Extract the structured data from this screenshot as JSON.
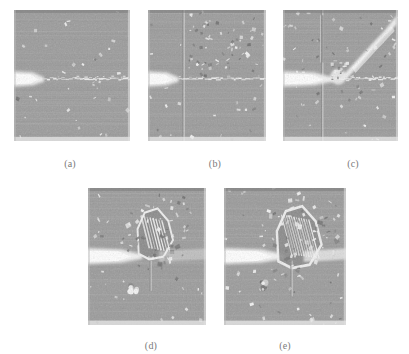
{
  "figure": {
    "name": "crack-tip-micrograph-series",
    "background_color": "#ffffff",
    "panel_base_color": "#9b9b9b",
    "bright_color": "#f2f2f2",
    "dark_color": "#6f6f6f",
    "caption_color": "#7a7a7a"
  },
  "panels": [
    {
      "id": "a",
      "caption": "(a)",
      "x": 14,
      "y": 10,
      "w": 116,
      "h": 131,
      "caption_x": 52,
      "caption_y": 158,
      "notch_y_frac": 0.53,
      "features": "horizontal notch with thin straight crack, sparse bright speckles",
      "speckle_count": 34,
      "has_vertical_boundary": false,
      "has_diagonal_streak": false,
      "damage_zone": "none"
    },
    {
      "id": "b",
      "caption": "(b)",
      "x": 148,
      "y": 10,
      "w": 118,
      "h": 131,
      "caption_x": 197,
      "caption_y": 158,
      "notch_y_frac": 0.53,
      "features": "horizontal notch, vertical grain boundary, dense bright speckle cloud",
      "speckle_count": 96,
      "has_vertical_boundary": true,
      "vertical_boundary_x_frac": 0.3,
      "has_diagonal_streak": false,
      "damage_zone": "none"
    },
    {
      "id": "c",
      "caption": "(c)",
      "x": 283,
      "y": 10,
      "w": 115,
      "h": 131,
      "caption_x": 335,
      "caption_y": 158,
      "notch_y_frac": 0.53,
      "features": "horizontal notch, vertical boundary, bright diagonal slip band to upper right, small crack tip damage",
      "speckle_count": 70,
      "has_vertical_boundary": true,
      "vertical_boundary_x_frac": 0.34,
      "has_diagonal_streak": true,
      "damage_zone": "small"
    },
    {
      "id": "d",
      "caption": "(d)",
      "x": 88,
      "y": 188,
      "w": 118,
      "h": 137,
      "caption_x": 133,
      "caption_y": 340,
      "notch_y_frac": 0.5,
      "features": "horizontal notch, large angular damage zone above crack tip, short vertical ligament below",
      "speckle_count": 60,
      "has_vertical_boundary": false,
      "has_diagonal_streak": false,
      "damage_zone": "large"
    },
    {
      "id": "e",
      "caption": "(e)",
      "x": 224,
      "y": 188,
      "w": 122,
      "h": 137,
      "caption_x": 267,
      "caption_y": 340,
      "notch_y_frac": 0.5,
      "features": "horizontal notch, very large striated damage zone spanning crack tip, vertical ligament below",
      "speckle_count": 72,
      "has_vertical_boundary": false,
      "has_diagonal_streak": false,
      "damage_zone": "very-large"
    }
  ]
}
